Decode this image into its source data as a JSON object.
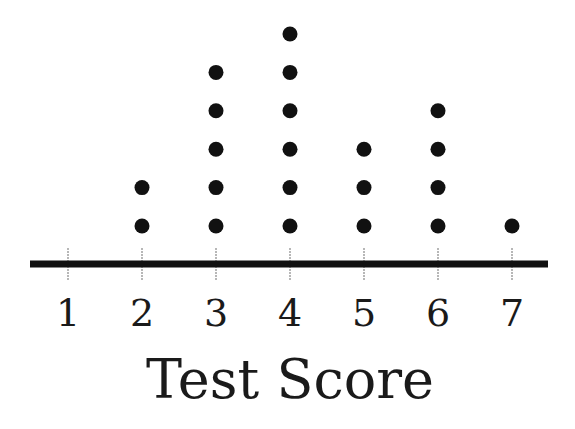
{
  "chart_data": {
    "type": "scatter",
    "subtype": "dot-plot",
    "title": "",
    "xlabel": "Test Score",
    "ylabel": "",
    "categories": [
      1,
      2,
      3,
      4,
      5,
      6,
      7
    ],
    "tick_labels": [
      "1",
      "2",
      "3",
      "4",
      "5",
      "6",
      "7"
    ],
    "counts": [
      0,
      2,
      5,
      6,
      3,
      4,
      1
    ],
    "xlim": [
      0.5,
      7.5
    ],
    "grid": false,
    "legend": "none",
    "colors": {
      "dot": "#111111",
      "axis": "#111111",
      "tick": "#888888"
    }
  }
}
